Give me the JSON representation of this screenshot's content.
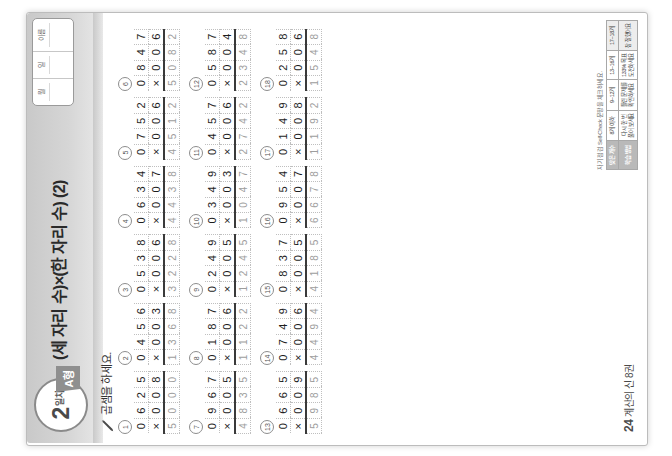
{
  "worksheet": {
    "day_number": "2",
    "day_label": "일차",
    "form_tag": "A형",
    "title": "(세 자리 수)×(한 자리 수) (2)",
    "instruction": "곱셈을 하세요.",
    "pencil_icon": "pencil-icon",
    "page_number": "24",
    "footer_label": "계산의 신 8권",
    "namebox": {
      "month_label": "월",
      "day_label": "일",
      "name_label": "이름"
    },
    "self_check": {
      "caption": "자기 점검 Self-Check  문항을 체크하세요.",
      "rows": [
        [
          "맞은 개수",
          "8개 이하",
          "9~12개",
          "13~16개",
          "17~18개"
        ],
        [
          "학습 방법",
          "다시 한 번\n풀어 보세요",
          "틀린 문제를\n확인하세요",
          "133% 목표\n도전하세요",
          "참 잘했어요"
        ]
      ]
    }
  },
  "problems": [
    {
      "n": "1",
      "multiplicand": "625",
      "multiplier": "8",
      "answer": "5000"
    },
    {
      "n": "2",
      "multiplicand": "456",
      "multiplier": "3",
      "answer": "1368"
    },
    {
      "n": "3",
      "multiplicand": "538",
      "multiplier": "6",
      "answer": "3228"
    },
    {
      "n": "4",
      "multiplicand": "634",
      "multiplier": "7",
      "answer": "4438"
    },
    {
      "n": "5",
      "multiplicand": "752",
      "multiplier": "6",
      "answer": "4512"
    },
    {
      "n": "6",
      "multiplicand": "847",
      "multiplier": "6",
      "answer": "5082"
    },
    {
      "n": "7",
      "multiplicand": "967",
      "multiplier": "5",
      "answer": "4835"
    },
    {
      "n": "8",
      "multiplicand": "187",
      "multiplier": "6",
      "answer": "1122"
    },
    {
      "n": "9",
      "multiplicand": "249",
      "multiplier": "5",
      "answer": "1245"
    },
    {
      "n": "10",
      "multiplicand": "349",
      "multiplier": "3",
      "answer": "1047"
    },
    {
      "n": "11",
      "multiplicand": "457",
      "multiplier": "6",
      "answer": "2742"
    },
    {
      "n": "12",
      "multiplicand": "587",
      "multiplier": "4",
      "answer": "2348"
    },
    {
      "n": "13",
      "multiplicand": "665",
      "multiplier": "9",
      "answer": "5985"
    },
    {
      "n": "14",
      "multiplicand": "749",
      "multiplier": "6",
      "answer": "4494"
    },
    {
      "n": "15",
      "multiplicand": "837",
      "multiplier": "5",
      "answer": "4185"
    },
    {
      "n": "16",
      "multiplicand": "954",
      "multiplier": "7",
      "answer": "6678"
    },
    {
      "n": "17",
      "multiplicand": "149",
      "multiplier": "8",
      "answer": "1192"
    },
    {
      "n": "18",
      "multiplicand": "258",
      "multiplier": "6",
      "answer": "1548"
    }
  ],
  "layout": {
    "columns": 6,
    "rows": 3
  },
  "colors": {
    "band": "#c9c9c9",
    "rule": "#3a3a3a",
    "answer_text": "#9d9d9d",
    "tag_bg": "#8f8f8f"
  }
}
